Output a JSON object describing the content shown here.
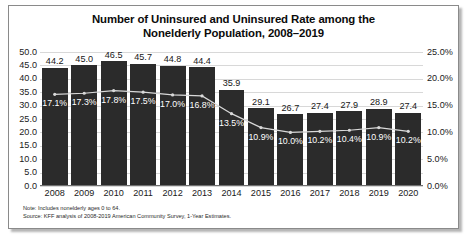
{
  "chart_data": {
    "type": "bar",
    "title": "Number of Uninsured and Uninsured Rate among the Nonelderly Population, 2008–2019",
    "title_lines": [
      "Number of Uninsured and Uninsured Rate among the",
      "Nonelderly Population, 2008–2019"
    ],
    "xlabel": "",
    "ylabel": "",
    "grid": true,
    "legend_position": "none",
    "categories": [
      "2008",
      "2009",
      "2010",
      "2011",
      "2012",
      "2013",
      "2014",
      "2015",
      "2016",
      "2017",
      "2018",
      "2019",
      "2020"
    ],
    "series": [
      {
        "name": "Number of Uninsured (millions)",
        "type": "bar",
        "axis": "left",
        "color": "#2b2b2b",
        "values": [
          44.2,
          45.0,
          46.5,
          45.7,
          44.8,
          44.4,
          35.9,
          29.1,
          26.7,
          27.4,
          27.9,
          28.9,
          27.4
        ],
        "labels": [
          "44.2",
          "45.0",
          "46.5",
          "45.7",
          "44.8",
          "44.4",
          "35.9",
          "29.1",
          "26.7",
          "27.4",
          "27.9",
          "28.9",
          "27.4"
        ]
      },
      {
        "name": "Uninsured Rate",
        "type": "line",
        "axis": "right",
        "color": "#d9d9d9",
        "values": [
          17.1,
          17.3,
          17.8,
          17.5,
          17.0,
          16.8,
          13.5,
          10.9,
          10.0,
          10.2,
          10.4,
          10.9,
          10.2
        ],
        "labels": [
          "17.1%",
          "17.3%",
          "17.8%",
          "17.5%",
          "17.0%",
          "16.8%",
          "13.5%",
          "10.9%",
          "10.0%",
          "10.2%",
          "10.4%",
          "10.9%",
          "10.2%"
        ]
      }
    ],
    "y_left": {
      "min": 0.0,
      "max": 50.0,
      "step": 5.0,
      "ticks": [
        "0.0",
        "5.0",
        "10.0",
        "15.0",
        "20.0",
        "25.0",
        "30.0",
        "35.0",
        "40.0",
        "45.0",
        "50.0"
      ]
    },
    "y_right": {
      "min": 0.0,
      "max": 25.0,
      "step": 5.0,
      "ticks": [
        "0.0%",
        "5.0%",
        "10.0%",
        "15.0%",
        "20.0%",
        "25.0%"
      ]
    }
  },
  "footnotes": {
    "note": "Note: Includes nonelderly ages 0 to 64.",
    "source": "Source: KFF analysis of 2008-2019 American Community Survey, 1-Year Estimates."
  }
}
